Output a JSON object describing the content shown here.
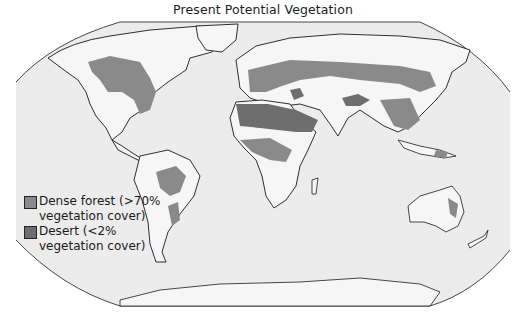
{
  "title": "Present Potential Vegetation",
  "legend": {
    "items": [
      {
        "label_line1": "Dense forest (>70%",
        "label_line2": "vegetation cover)",
        "color": "#8a8a8a"
      },
      {
        "label_line1": "Desert (<2%",
        "label_line2": "vegetation cover)",
        "color": "#6e6e6e"
      }
    ]
  },
  "colors": {
    "ocean": "#ececec",
    "land": "#f6f6f6",
    "outline": "#1a1a1a",
    "forest": "#8a8a8a",
    "desert": "#6e6e6e"
  }
}
